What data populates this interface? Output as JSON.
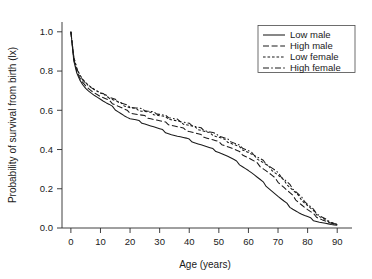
{
  "chart_data": {
    "type": "line",
    "title": "",
    "xlabel": "Age (years)",
    "ylabel": "Probability of survival from birth (lx)",
    "xlim": [
      -3,
      95
    ],
    "ylim": [
      0.0,
      1.05
    ],
    "xticks": [
      0,
      10,
      20,
      30,
      40,
      50,
      60,
      70,
      80,
      90
    ],
    "xtick_labels": [
      "0",
      "10",
      "20",
      "30",
      "40",
      "50",
      "60",
      "70",
      "80",
      "90"
    ],
    "yticks": [
      0.0,
      0.2,
      0.4,
      0.6,
      0.8,
      1.0
    ],
    "ytick_labels": [
      "0.0",
      "0.2",
      "0.4",
      "0.6",
      "0.8",
      "1.0"
    ],
    "grid": false,
    "legend_position": "top-right",
    "x": [
      0,
      1,
      2,
      3,
      4,
      5,
      6,
      7,
      8,
      9,
      10,
      11,
      12,
      13,
      14,
      15,
      16,
      17,
      18,
      19,
      20,
      21,
      22,
      23,
      24,
      25,
      26,
      27,
      28,
      29,
      30,
      31,
      32,
      33,
      34,
      35,
      36,
      37,
      38,
      39,
      40,
      41,
      42,
      43,
      44,
      45,
      46,
      47,
      48,
      49,
      50,
      51,
      52,
      53,
      54,
      55,
      56,
      57,
      58,
      59,
      60,
      61,
      62,
      63,
      64,
      65,
      66,
      67,
      68,
      69,
      70,
      71,
      72,
      73,
      74,
      75,
      76,
      77,
      78,
      79,
      80,
      81,
      82,
      83,
      84,
      85,
      86,
      87,
      88,
      89,
      90
    ],
    "series": [
      {
        "name": "Low male",
        "line_style": "solid",
        "color": "#1a1a1a",
        "values": [
          1.0,
          0.85,
          0.79,
          0.755,
          0.73,
          0.712,
          0.698,
          0.686,
          0.675,
          0.666,
          0.656,
          0.646,
          0.636,
          0.627,
          0.617,
          0.607,
          0.596,
          0.585,
          0.574,
          0.564,
          0.556,
          0.552,
          0.548,
          0.543,
          0.538,
          0.533,
          0.527,
          0.521,
          0.515,
          0.509,
          0.503,
          0.497,
          0.49,
          0.484,
          0.478,
          0.473,
          0.468,
          0.464,
          0.459,
          0.454,
          0.448,
          0.442,
          0.436,
          0.43,
          0.424,
          0.418,
          0.412,
          0.406,
          0.4,
          0.394,
          0.388,
          0.381,
          0.373,
          0.365,
          0.356,
          0.347,
          0.337,
          0.327,
          0.316,
          0.305,
          0.294,
          0.282,
          0.269,
          0.256,
          0.243,
          0.23,
          0.216,
          0.202,
          0.188,
          0.174,
          0.16,
          0.147,
          0.134,
          0.122,
          0.11,
          0.099,
          0.089,
          0.079,
          0.07,
          0.062,
          0.055,
          0.048,
          0.042,
          0.037,
          0.032,
          0.028,
          0.024,
          0.021,
          0.018,
          0.016,
          0.014
        ]
      },
      {
        "name": "High male",
        "line_style": "dashed",
        "color": "#1a1a1a",
        "values": [
          1.0,
          0.86,
          0.8,
          0.765,
          0.742,
          0.724,
          0.71,
          0.698,
          0.688,
          0.679,
          0.67,
          0.662,
          0.654,
          0.646,
          0.638,
          0.63,
          0.621,
          0.613,
          0.604,
          0.596,
          0.589,
          0.585,
          0.581,
          0.577,
          0.573,
          0.569,
          0.564,
          0.56,
          0.555,
          0.55,
          0.545,
          0.54,
          0.535,
          0.53,
          0.525,
          0.52,
          0.515,
          0.51,
          0.505,
          0.5,
          0.494,
          0.489,
          0.483,
          0.478,
          0.472,
          0.467,
          0.461,
          0.455,
          0.449,
          0.443,
          0.437,
          0.43,
          0.423,
          0.416,
          0.409,
          0.401,
          0.393,
          0.385,
          0.376,
          0.367,
          0.358,
          0.348,
          0.338,
          0.327,
          0.316,
          0.304,
          0.292,
          0.279,
          0.266,
          0.252,
          0.238,
          0.223,
          0.208,
          0.193,
          0.178,
          0.163,
          0.148,
          0.133,
          0.119,
          0.105,
          0.092,
          0.08,
          0.069,
          0.059,
          0.05,
          0.042,
          0.035,
          0.029,
          0.024,
          0.02,
          0.017
        ]
      },
      {
        "name": "Low female",
        "line_style": "dotted",
        "color": "#1a1a1a",
        "values": [
          1.0,
          0.87,
          0.815,
          0.781,
          0.758,
          0.741,
          0.727,
          0.716,
          0.706,
          0.697,
          0.688,
          0.68,
          0.672,
          0.664,
          0.657,
          0.649,
          0.641,
          0.633,
          0.626,
          0.619,
          0.613,
          0.609,
          0.605,
          0.601,
          0.597,
          0.593,
          0.589,
          0.585,
          0.581,
          0.577,
          0.572,
          0.568,
          0.563,
          0.558,
          0.553,
          0.548,
          0.543,
          0.538,
          0.533,
          0.528,
          0.523,
          0.517,
          0.511,
          0.505,
          0.499,
          0.493,
          0.487,
          0.481,
          0.475,
          0.468,
          0.462,
          0.455,
          0.448,
          0.441,
          0.434,
          0.426,
          0.418,
          0.41,
          0.402,
          0.393,
          0.384,
          0.375,
          0.365,
          0.355,
          0.344,
          0.333,
          0.321,
          0.309,
          0.296,
          0.283,
          0.269,
          0.255,
          0.24,
          0.225,
          0.209,
          0.193,
          0.177,
          0.161,
          0.145,
          0.129,
          0.114,
          0.099,
          0.085,
          0.072,
          0.06,
          0.05,
          0.041,
          0.033,
          0.027,
          0.022,
          0.018
        ]
      },
      {
        "name": "High female",
        "line_style": "dashdot",
        "color": "#1a1a1a",
        "values": [
          1.0,
          0.868,
          0.812,
          0.778,
          0.755,
          0.738,
          0.725,
          0.714,
          0.704,
          0.696,
          0.688,
          0.681,
          0.674,
          0.667,
          0.66,
          0.653,
          0.646,
          0.639,
          0.632,
          0.625,
          0.62,
          0.616,
          0.612,
          0.608,
          0.604,
          0.6,
          0.596,
          0.592,
          0.588,
          0.584,
          0.58,
          0.575,
          0.571,
          0.566,
          0.561,
          0.556,
          0.551,
          0.546,
          0.541,
          0.536,
          0.531,
          0.526,
          0.52,
          0.514,
          0.508,
          0.502,
          0.496,
          0.49,
          0.484,
          0.477,
          0.471,
          0.464,
          0.457,
          0.45,
          0.443,
          0.435,
          0.427,
          0.419,
          0.411,
          0.402,
          0.393,
          0.384,
          0.374,
          0.364,
          0.353,
          0.342,
          0.33,
          0.318,
          0.305,
          0.292,
          0.278,
          0.264,
          0.249,
          0.234,
          0.218,
          0.202,
          0.186,
          0.17,
          0.154,
          0.138,
          0.122,
          0.107,
          0.092,
          0.078,
          0.065,
          0.054,
          0.044,
          0.036,
          0.029,
          0.023,
          0.019
        ]
      }
    ]
  },
  "legend": {
    "items": [
      {
        "label": "Low male",
        "style": "solid"
      },
      {
        "label": "High male",
        "style": "dashed"
      },
      {
        "label": "Low female",
        "style": "dotted"
      },
      {
        "label": "High female",
        "style": "dashdot"
      }
    ]
  }
}
